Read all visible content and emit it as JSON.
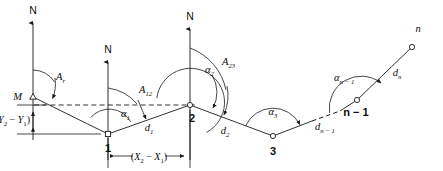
{
  "figure": {
    "background_color": "#ffffff",
    "ink_color": "#1a1a1a"
  },
  "north_arrows": [
    {
      "id": "north-at-m",
      "label": "N"
    },
    {
      "id": "north-at-1",
      "label": "N"
    },
    {
      "id": "north-at-2",
      "label": "N"
    }
  ],
  "stations": [
    {
      "id": "station-m",
      "label": "M"
    },
    {
      "id": "station-1",
      "label": "1"
    },
    {
      "id": "station-2",
      "label": "2"
    },
    {
      "id": "station-3",
      "label": "3"
    },
    {
      "id": "station-n-minus-1",
      "label": "n − 1"
    },
    {
      "id": "station-n",
      "label": "n"
    }
  ],
  "azimuths": [
    {
      "id": "azimuth-ar",
      "base": "A",
      "sub": "r"
    },
    {
      "id": "azimuth-a12",
      "base": "A",
      "sub": "12"
    },
    {
      "id": "azimuth-a23",
      "base": "A",
      "sub": "23"
    }
  ],
  "angles": [
    {
      "id": "angle-alpha1",
      "base": "α",
      "sub": "1"
    },
    {
      "id": "angle-alpha2",
      "base": "α",
      "sub": "2"
    },
    {
      "id": "angle-alpha3",
      "base": "α",
      "sub": "3"
    },
    {
      "id": "angle-alpha-n-minus-1",
      "base": "α",
      "sub": "n − 1"
    }
  ],
  "distances": [
    {
      "id": "distance-d1",
      "base": "d",
      "sub": "1"
    },
    {
      "id": "distance-d2",
      "base": "d",
      "sub": "2"
    },
    {
      "id": "distance-dn-minus-1",
      "base": "d",
      "sub": "n − 1"
    },
    {
      "id": "distance-dn",
      "base": "d",
      "sub": "n"
    }
  ],
  "dimensions": [
    {
      "id": "dimension-delta-y",
      "open": "(",
      "first_base": "Y",
      "first_sub": "2",
      "operator": " − ",
      "second_base": "Y",
      "second_sub": "1",
      "close": ")"
    },
    {
      "id": "dimension-delta-x",
      "open": "(",
      "first_base": "X",
      "first_sub": "2",
      "operator": " − ",
      "second_base": "X",
      "second_sub": "1",
      "close": ")"
    }
  ]
}
